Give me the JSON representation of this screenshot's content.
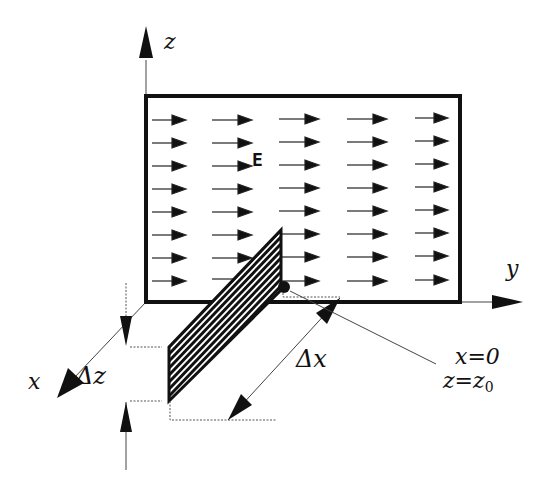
{
  "diagram": {
    "axes": {
      "z_label": "z",
      "y_label": "y",
      "x_label": "x"
    },
    "field": {
      "label": "E",
      "rows": 8,
      "columns": 5,
      "direction": "+y"
    },
    "dimensions": {
      "delta_z": "Δz",
      "delta_x": "Δx"
    },
    "point_annotation": {
      "line1": "x=0",
      "line2_main": "z=z",
      "line2_sub": "0"
    },
    "colors": {
      "ink": "#111111",
      "background": "#ffffff"
    }
  }
}
